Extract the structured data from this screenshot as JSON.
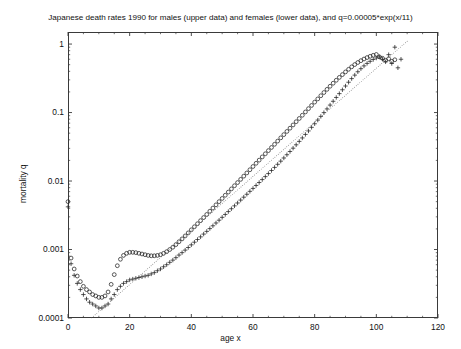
{
  "chart_data": {
    "type": "scatter",
    "title": "Japanese death rates 1990 for males (upper data) and females (lower data), and q=0.00005*exp(x/11)",
    "xlabel": "age x",
    "ylabel": "mortality q",
    "xlim": [
      0,
      120
    ],
    "ylim": [
      0.0001,
      1.5
    ],
    "yscale": "log",
    "xticks": [
      0,
      20,
      40,
      60,
      80,
      100,
      120
    ],
    "xtick_labels": [
      "0",
      "20",
      "40",
      "60",
      "80",
      "100",
      "120"
    ],
    "yticks": [
      0.0001,
      0.001,
      0.01,
      0.1,
      1
    ],
    "ytick_labels": [
      "0.0001",
      "0.001",
      "0.01",
      "0.1",
      "1"
    ],
    "grid": false,
    "legend": "none",
    "minor_ticks": true,
    "series": [
      {
        "name": "males",
        "marker": "circle",
        "color": "#222222",
        "x": [
          0,
          1,
          2,
          3,
          4,
          5,
          6,
          7,
          8,
          9,
          10,
          11,
          12,
          13,
          14,
          15,
          16,
          17,
          18,
          19,
          20,
          21,
          22,
          23,
          24,
          25,
          26,
          27,
          28,
          29,
          30,
          31,
          32,
          33,
          34,
          35,
          36,
          37,
          38,
          39,
          40,
          41,
          42,
          43,
          44,
          45,
          46,
          47,
          48,
          49,
          50,
          51,
          52,
          53,
          54,
          55,
          56,
          57,
          58,
          59,
          60,
          61,
          62,
          63,
          64,
          65,
          66,
          67,
          68,
          69,
          70,
          71,
          72,
          73,
          74,
          75,
          76,
          77,
          78,
          79,
          80,
          81,
          82,
          83,
          84,
          85,
          86,
          87,
          88,
          89,
          90,
          91,
          92,
          93,
          94,
          95,
          96,
          97,
          98,
          99,
          100,
          101,
          102,
          103,
          104,
          105,
          106
        ],
        "y": [
          0.005,
          0.00075,
          0.00052,
          0.00041,
          0.00034,
          0.00029,
          0.00026,
          0.00024,
          0.00022,
          0.00021,
          0.0002,
          0.0002,
          0.00021,
          0.00024,
          0.00031,
          0.00043,
          0.00058,
          0.00072,
          0.00082,
          0.00088,
          0.00091,
          0.00091,
          0.0009,
          0.00088,
          0.00086,
          0.00084,
          0.00082,
          0.00081,
          0.00081,
          0.00082,
          0.00084,
          0.00088,
          0.00093,
          0.001,
          0.00108,
          0.00118,
          0.0013,
          0.00143,
          0.00158,
          0.00175,
          0.00194,
          0.00215,
          0.00238,
          0.00264,
          0.00293,
          0.00325,
          0.00362,
          0.00403,
          0.00449,
          0.005,
          0.00557,
          0.0062,
          0.0069,
          0.00768,
          0.00854,
          0.0095,
          0.01058,
          0.01178,
          0.01312,
          0.01462,
          0.0163,
          0.01815,
          0.0202,
          0.0225,
          0.025,
          0.0278,
          0.0309,
          0.0344,
          0.0383,
          0.0427,
          0.0476,
          0.053,
          0.0591,
          0.0659,
          0.0735,
          0.0819,
          0.0913,
          0.102,
          0.114,
          0.127,
          0.142,
          0.158,
          0.176,
          0.196,
          0.218,
          0.242,
          0.268,
          0.296,
          0.326,
          0.358,
          0.392,
          0.428,
          0.465,
          0.502,
          0.538,
          0.572,
          0.605,
          0.635,
          0.662,
          0.685,
          0.705,
          0.65,
          0.62,
          0.58,
          0.61,
          0.56,
          0.59
        ]
      },
      {
        "name": "females",
        "marker": "plus",
        "color": "#222222",
        "x": [
          0,
          1,
          2,
          3,
          4,
          5,
          6,
          7,
          8,
          9,
          10,
          11,
          12,
          13,
          14,
          15,
          16,
          17,
          18,
          19,
          20,
          21,
          22,
          23,
          24,
          25,
          26,
          27,
          28,
          29,
          30,
          31,
          32,
          33,
          34,
          35,
          36,
          37,
          38,
          39,
          40,
          41,
          42,
          43,
          44,
          45,
          46,
          47,
          48,
          49,
          50,
          51,
          52,
          53,
          54,
          55,
          56,
          57,
          58,
          59,
          60,
          61,
          62,
          63,
          64,
          65,
          66,
          67,
          68,
          69,
          70,
          71,
          72,
          73,
          74,
          75,
          76,
          77,
          78,
          79,
          80,
          81,
          82,
          83,
          84,
          85,
          86,
          87,
          88,
          89,
          90,
          91,
          92,
          93,
          94,
          95,
          96,
          97,
          98,
          99,
          100,
          101,
          102,
          103,
          104,
          105,
          106,
          107,
          108
        ],
        "y": [
          0.0042,
          0.00062,
          0.00042,
          0.00032,
          0.00026,
          0.00022,
          0.00019,
          0.00017,
          0.00016,
          0.00015,
          0.00014,
          0.00014,
          0.00015,
          0.00016,
          0.00019,
          0.00022,
          0.00026,
          0.00029,
          0.00032,
          0.00034,
          0.00036,
          0.00037,
          0.00038,
          0.00039,
          0.0004,
          0.00041,
          0.00042,
          0.00044,
          0.00046,
          0.00049,
          0.00052,
          0.00056,
          0.0006,
          0.00065,
          0.0007,
          0.00076,
          0.00083,
          0.0009,
          0.00098,
          0.00107,
          0.00117,
          0.00128,
          0.0014,
          0.00153,
          0.00168,
          0.00184,
          0.00202,
          0.00222,
          0.00244,
          0.00268,
          0.00295,
          0.00325,
          0.00358,
          0.00394,
          0.00434,
          0.00478,
          0.00527,
          0.00581,
          0.00641,
          0.00707,
          0.0078,
          0.00861,
          0.00951,
          0.0105,
          0.0116,
          0.01285,
          0.01425,
          0.0158,
          0.01755,
          0.0195,
          0.0217,
          0.0242,
          0.027,
          0.0302,
          0.0338,
          0.0379,
          0.0426,
          0.0479,
          0.0539,
          0.0608,
          0.0686,
          0.0776,
          0.0879,
          0.0997,
          0.113,
          0.1285,
          0.146,
          0.166,
          0.189,
          0.215,
          0.244,
          0.277,
          0.313,
          0.352,
          0.394,
          0.437,
          0.48,
          0.522,
          0.56,
          0.595,
          0.625,
          0.65,
          0.6,
          0.55,
          0.7,
          0.52,
          0.9,
          0.45,
          0.6
        ]
      },
      {
        "name": "q=0.00005*exp(x/11)",
        "marker": "dot-line",
        "color": "#555555",
        "formula_a": 5e-05,
        "formula_b": 11,
        "x_start": 0,
        "x_end": 110
      }
    ]
  }
}
